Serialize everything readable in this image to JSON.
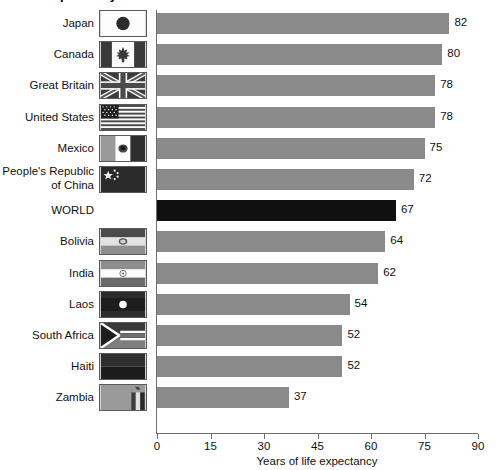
{
  "chart_data": {
    "type": "bar",
    "orientation": "horizontal",
    "title": "Life expectancy at birth in selected countries",
    "xlabel": "Years of life expectancy",
    "ylabel": "",
    "xlim": [
      0,
      90
    ],
    "xticks": [
      0,
      15,
      30,
      45,
      60,
      75,
      90
    ],
    "grid": false,
    "legend": false,
    "highlight_category": "WORLD",
    "colors": {
      "bar": "#8a8a8a",
      "bar_highlight": "#101010",
      "axis": "#6e6e6e",
      "text": "#111111",
      "background": "#ffffff"
    },
    "categories": [
      "Japan",
      "Canada",
      "Great Britain",
      "United States",
      "Mexico",
      "People's Republic of China",
      "WORLD",
      "Bolivia",
      "India",
      "Laos",
      "South Africa",
      "Haiti",
      "Zambia"
    ],
    "values": [
      82,
      80,
      78,
      78,
      75,
      72,
      67,
      64,
      62,
      54,
      52,
      52,
      37
    ]
  },
  "rows": [
    {
      "label": "Japan",
      "label_lines": "Japan",
      "value": 82,
      "flag": "flag-japan",
      "highlight": false
    },
    {
      "label": "Canada",
      "label_lines": "Canada",
      "value": 80,
      "flag": "flag-canada",
      "highlight": false
    },
    {
      "label": "Great Britain",
      "label_lines": "Great Britain",
      "value": 78,
      "flag": "flag-great-britain",
      "highlight": false
    },
    {
      "label": "United States",
      "label_lines": "United States",
      "value": 78,
      "flag": "flag-united-states",
      "highlight": false
    },
    {
      "label": "Mexico",
      "label_lines": "Mexico",
      "value": 75,
      "flag": "flag-mexico",
      "highlight": false
    },
    {
      "label": "People's Republic of China",
      "label_lines": "People's Republic\nof China",
      "value": 72,
      "flag": "flag-china",
      "highlight": false
    },
    {
      "label": "WORLD",
      "label_lines": "WORLD",
      "value": 67,
      "flag": null,
      "highlight": true
    },
    {
      "label": "Bolivia",
      "label_lines": "Bolivia",
      "value": 64,
      "flag": "flag-bolivia",
      "highlight": false
    },
    {
      "label": "India",
      "label_lines": "India",
      "value": 62,
      "flag": "flag-india",
      "highlight": false
    },
    {
      "label": "Laos",
      "label_lines": "Laos",
      "value": 54,
      "flag": "flag-laos",
      "highlight": false
    },
    {
      "label": "South Africa",
      "label_lines": "South Africa",
      "value": 52,
      "flag": "flag-south-africa",
      "highlight": false
    },
    {
      "label": "Haiti",
      "label_lines": "Haiti",
      "value": 52,
      "flag": "flag-haiti",
      "highlight": false
    },
    {
      "label": "Zambia",
      "label_lines": "Zambia",
      "value": 37,
      "flag": "flag-zambia",
      "highlight": false
    }
  ],
  "axis": {
    "ticks": [
      "0",
      "15",
      "30",
      "45",
      "60",
      "75",
      "90"
    ],
    "tick_values": [
      0,
      15,
      30,
      45,
      60,
      75,
      90
    ],
    "title": "Years of life expectancy"
  }
}
